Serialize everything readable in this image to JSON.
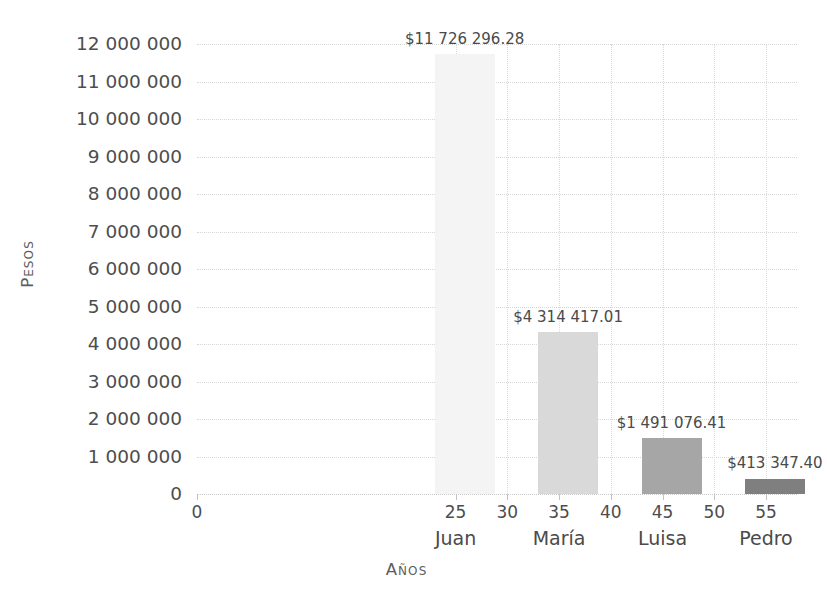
{
  "chart_data": {
    "type": "bar",
    "title": "",
    "xlabel": "Años",
    "ylabel": "Pesos",
    "x": [
      25,
      35,
      45,
      55
    ],
    "categories": [
      "Juan",
      "María",
      "Luisa",
      "Pedro"
    ],
    "values": [
      11726296.28,
      4314417.01,
      1491076.41,
      413347.4
    ],
    "data_labels": [
      "$11 726 296.28",
      "$4 314 417.01",
      "$1 491 076.41",
      "$413 347.40"
    ],
    "bar_colors": [
      "#f4f4f4",
      "#d9d9d9",
      "#a6a6a6",
      "#7f7f7f"
    ],
    "ylim": [
      0,
      12000000
    ],
    "xlim": [
      0,
      58
    ],
    "grid": true,
    "legend": "none",
    "y_ticks": [
      {
        "value": 0,
        "label": "0"
      },
      {
        "value": 1000000,
        "label": "1 000 000"
      },
      {
        "value": 2000000,
        "label": "2 000 000"
      },
      {
        "value": 3000000,
        "label": "3 000 000"
      },
      {
        "value": 4000000,
        "label": "4 000 000"
      },
      {
        "value": 5000000,
        "label": "5 000 000"
      },
      {
        "value": 6000000,
        "label": "6 000 000"
      },
      {
        "value": 7000000,
        "label": "7 000 000"
      },
      {
        "value": 8000000,
        "label": "8 000 000"
      },
      {
        "value": 9000000,
        "label": "9 000 000"
      },
      {
        "value": 10000000,
        "label": "10 000 000"
      },
      {
        "value": 11000000,
        "label": "11 000 000"
      },
      {
        "value": 12000000,
        "label": "12 000 000"
      }
    ],
    "x_ticks": [
      {
        "value": 0,
        "label": "0"
      },
      {
        "value": 25,
        "label": "25"
      },
      {
        "value": 30,
        "label": "30"
      },
      {
        "value": 35,
        "label": "35"
      },
      {
        "value": 40,
        "label": "40"
      },
      {
        "value": 45,
        "label": "45"
      },
      {
        "value": 50,
        "label": "50"
      },
      {
        "value": 55,
        "label": "55"
      }
    ]
  }
}
